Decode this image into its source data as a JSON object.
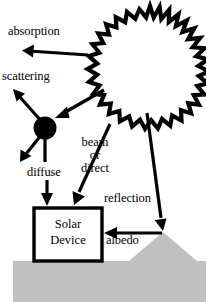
{
  "figure": {
    "background_color": "#ffffff",
    "line_color": "#000000",
    "ground_color": "#c0c0c0"
  },
  "labels": {
    "absorption": "absorption",
    "scattering": "scattering",
    "diffuse": "diffuse",
    "beam": "beam",
    "or": "or",
    "direct": "direct",
    "reflection": "reflection",
    "albedo": "albedo"
  },
  "device": {
    "line1": "Solar",
    "line2": "Device"
  },
  "elements": {
    "sun": "sun-starburst",
    "scatter_node": "scattering-particle",
    "ground": "ground-surface",
    "hill": "hill-triangle",
    "box": "solar-device-box"
  }
}
